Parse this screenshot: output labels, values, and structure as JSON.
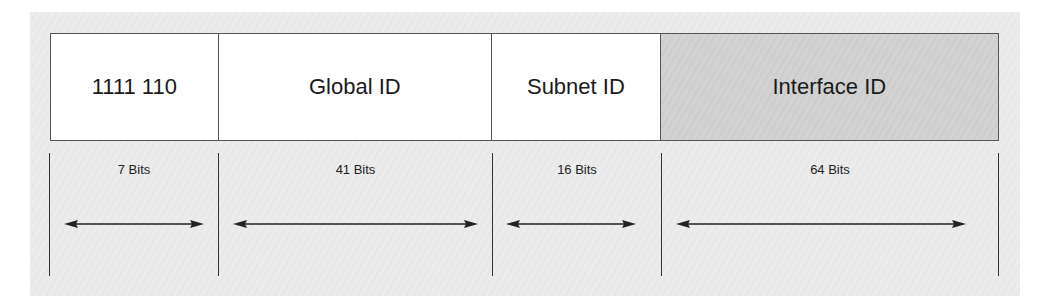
{
  "diagram": {
    "fields": [
      {
        "label": "1111 110",
        "bits": "7 Bits",
        "shaded": false
      },
      {
        "label": "Global ID",
        "bits": "41 Bits",
        "shaded": false
      },
      {
        "label": "Subnet ID",
        "bits": "16 Bits",
        "shaded": false
      },
      {
        "label": "Interface ID",
        "bits": "64 Bits",
        "shaded": true
      }
    ],
    "colors": {
      "border": "#555555",
      "shaded_fill": "#cfcfcf",
      "background": "#e9e9e9"
    }
  }
}
